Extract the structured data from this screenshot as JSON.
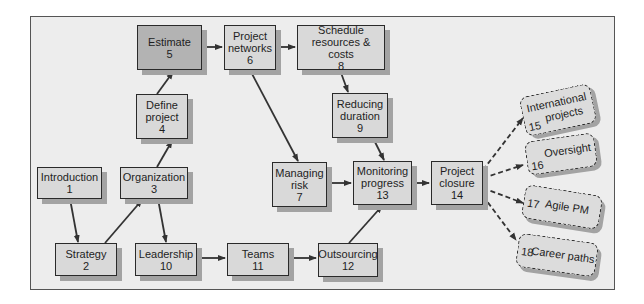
{
  "diagram": {
    "nodes": [
      {
        "id": 1,
        "label": "Introduction",
        "num": "1"
      },
      {
        "id": 2,
        "label": "Strategy",
        "num": "2"
      },
      {
        "id": 3,
        "label": "Organization",
        "num": "3"
      },
      {
        "id": 4,
        "label_l1": "Define",
        "label_l2": "project",
        "num": "4"
      },
      {
        "id": 5,
        "label": "Estimate",
        "num": "5"
      },
      {
        "id": 6,
        "label_l1": "Project",
        "label_l2": "networks",
        "num": "6"
      },
      {
        "id": 7,
        "label_l1": "Managing",
        "label_l2": "risk",
        "num": "7"
      },
      {
        "id": 8,
        "label_l1": "Schedule",
        "label_l2": "resources & costs",
        "num": "8"
      },
      {
        "id": 9,
        "label_l1": "Reducing",
        "label_l2": "duration",
        "num": "9"
      },
      {
        "id": 10,
        "label": "Leadership",
        "num": "10"
      },
      {
        "id": 11,
        "label": "Teams",
        "num": "11"
      },
      {
        "id": 12,
        "label": "Outsourcing",
        "num": "12"
      },
      {
        "id": 13,
        "label_l1": "Monitoring",
        "label_l2": "progress",
        "num": "13"
      },
      {
        "id": 14,
        "label_l1": "Project",
        "label_l2": "closure",
        "num": "14"
      }
    ],
    "optional_nodes": [
      {
        "id": 15,
        "label_l1": "International",
        "label_l2": "projects",
        "num": "15"
      },
      {
        "id": 16,
        "label": "Oversight",
        "num": "16"
      },
      {
        "id": 17,
        "label": "Agile PM",
        "num": "17"
      },
      {
        "id": 18,
        "label": "Career paths",
        "num": "18"
      }
    ],
    "edges": [
      [
        "1",
        "2"
      ],
      [
        "2",
        "3"
      ],
      [
        "3",
        "4"
      ],
      [
        "3",
        "10"
      ],
      [
        "4",
        "5"
      ],
      [
        "5",
        "6"
      ],
      [
        "6",
        "8"
      ],
      [
        "6",
        "7"
      ],
      [
        "8",
        "9"
      ],
      [
        "9",
        "13"
      ],
      [
        "7",
        "13"
      ],
      [
        "10",
        "11"
      ],
      [
        "11",
        "12"
      ],
      [
        "12",
        "13"
      ],
      [
        "13",
        "14"
      ],
      [
        "14",
        "15"
      ],
      [
        "14",
        "16"
      ],
      [
        "14",
        "17"
      ],
      [
        "14",
        "18"
      ]
    ],
    "colors": {
      "box": "#d9d9d9",
      "highlight_box": "#b3b3b3",
      "shadow": "#a3a3a3",
      "background": "#ededed",
      "line": "#333333"
    }
  }
}
